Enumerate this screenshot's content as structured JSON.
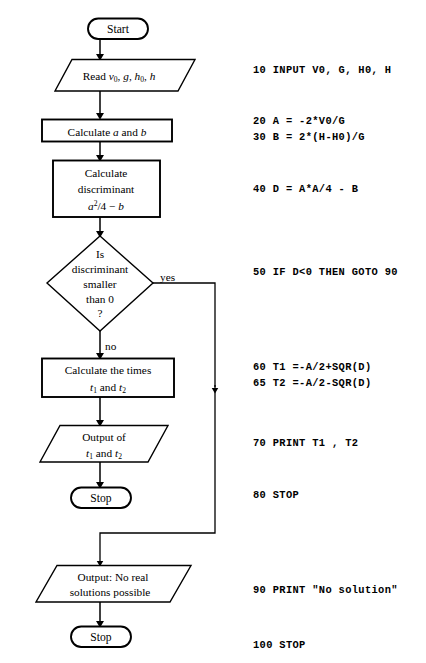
{
  "diagram": {
    "kind": "flowchart",
    "title_text": "",
    "nodes": {
      "start": {
        "label": "Start",
        "shape": "terminator"
      },
      "read": {
        "line1_pre": "Read ",
        "vars": "v0, g, h0, h",
        "shape": "parallelogram-io"
      },
      "calc_ab": {
        "label": "Calculate a and b",
        "shape": "process"
      },
      "calc_disc": {
        "line1": "Calculate",
        "line2": "discriminant",
        "line3": "a2/4 − b",
        "shape": "process"
      },
      "decision": {
        "line1": "Is",
        "line2": "discriminant",
        "line3": "smaller",
        "line4": "than 0",
        "line5": "?",
        "shape": "decision"
      },
      "calc_times": {
        "line1": "Calculate the times",
        "line2": "t1 and t2",
        "shape": "process"
      },
      "output_times": {
        "line1": "Output of",
        "line2": "t1 and t2",
        "shape": "parallelogram-io"
      },
      "stop_1": {
        "label": "Stop",
        "shape": "terminator"
      },
      "output_nosol": {
        "line1": "Output: No real",
        "line2": "solutions possible",
        "shape": "parallelogram-io"
      },
      "stop_2": {
        "label": "Stop",
        "shape": "terminator"
      }
    },
    "branch_labels": {
      "yes": "yes",
      "no": "no"
    }
  },
  "code": {
    "language": "BASIC",
    "lines": [
      {
        "text": "10 INPUT V0, G, H0, H",
        "top": 70
      },
      {
        "text": "20 A = -2*V0/G",
        "top": 121
      },
      {
        "text": "30 B = 2*(H-H0)/G",
        "top": 137
      },
      {
        "text": "40 D = A*A/4 - B",
        "top": 189
      },
      {
        "text": "50 IF D<0 THEN GOTO 90",
        "top": 272
      },
      {
        "text": "60 T1 =-A/2+SQR(D)",
        "top": 367
      },
      {
        "text": "65 T2 =-A/2-SQR(D)",
        "top": 383
      },
      {
        "text": "70 PRINT T1 , T2",
        "top": 443
      },
      {
        "text": "80 STOP",
        "top": 495
      },
      {
        "text": "90 PRINT \"No solution\"",
        "top": 590
      },
      {
        "text": "100 STOP",
        "top": 645
      }
    ]
  },
  "colors": {
    "background": "#ffffff",
    "stroke": "#000000",
    "text": "#000000"
  }
}
